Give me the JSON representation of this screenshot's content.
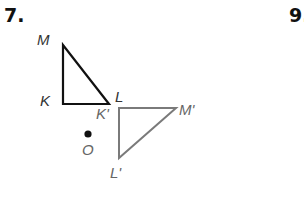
{
  "problems": [
    {
      "number": "7."
    },
    {
      "number": "9."
    }
  ],
  "figure": {
    "original_triangle": {
      "vertices": {
        "M": "M",
        "K": "K",
        "L": "L"
      },
      "color": "#111111"
    },
    "image_triangle": {
      "vertices": {
        "K_prime": "K'",
        "M_prime": "M'",
        "L_prime": "L'"
      },
      "color": "#7a7a7a"
    },
    "center": {
      "label": "O"
    }
  }
}
